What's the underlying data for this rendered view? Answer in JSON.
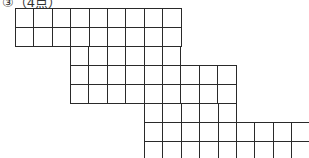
{
  "question": {
    "label": "③（4点）"
  },
  "grid": {
    "line_color": "#2a2a2a",
    "cell_width": 18.4,
    "cell_height": 19,
    "rows": [
      {
        "y": 8,
        "x_start": 15,
        "cells": 9
      },
      {
        "y": 27,
        "x_start": 15,
        "cells": 9
      },
      {
        "y": 46,
        "x_start": 70,
        "cells": 6
      },
      {
        "y": 65,
        "x_start": 70,
        "cells": 9
      },
      {
        "y": 84,
        "x_start": 70,
        "cells": 9
      },
      {
        "y": 103,
        "x_start": 144,
        "cells": 5
      },
      {
        "y": 122,
        "x_start": 144,
        "cells": 9
      },
      {
        "y": 141,
        "x_start": 144,
        "cells": 9
      }
    ]
  }
}
